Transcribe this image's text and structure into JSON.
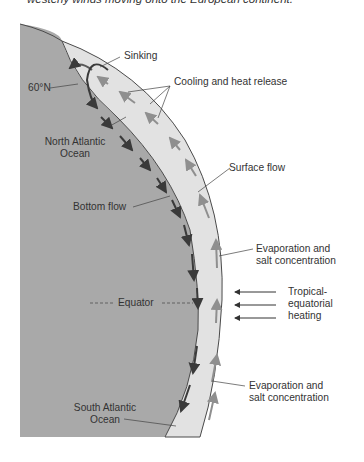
{
  "caption": "westerly winds moving onto the European continent.",
  "diagram": {
    "colors": {
      "land": "#a9a9a9",
      "ocean_band": "#e2e2e2",
      "bottom_flow_arrows": "#3a3a3a",
      "surface_flow_arrows": "#8f8f8f",
      "outline": "#4a4a4a"
    },
    "labels": {
      "sinking": "Sinking",
      "cooling": "Cooling and heat release",
      "lat60": "60°N",
      "north_atlantic_1": "North Atlantic",
      "north_atlantic_2": "Ocean",
      "surface_flow": "Surface flow",
      "bottom_flow": "Bottom flow",
      "evap1_1": "Evaporation and",
      "evap1_2": "salt concentration",
      "tropical_1": "Tropical-",
      "tropical_2": "equatorial",
      "tropical_3": "heating",
      "equator": "Equator",
      "evap2_1": "Evaporation and",
      "evap2_2": "salt concentration",
      "south_atlantic_1": "South Atlantic",
      "south_atlantic_2": "Ocean"
    }
  }
}
